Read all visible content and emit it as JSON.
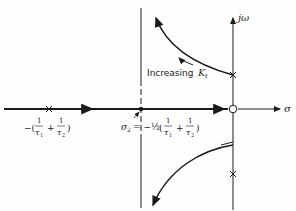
{
  "diagram": {
    "type": "root-locus",
    "axes": {
      "real_label": "σ",
      "imag_label": "jω"
    },
    "annotations": {
      "increasing_label": "Increasing",
      "increasing_symbol": "K",
      "increasing_sub": "t",
      "pole_label_lead": "−(",
      "frac_num": "1",
      "tau1": "τ",
      "tau1_sub": "1",
      "tau2": "τ",
      "tau2_sub": "2",
      "plus": "+",
      "close_paren": ")",
      "sigma2": "σ",
      "sigma2_sub": "2",
      "sigma2_eq": "= −½",
      "open_paren": "("
    },
    "colors": {
      "ink": "#1a1a1a",
      "background": "#fefefe"
    }
  }
}
